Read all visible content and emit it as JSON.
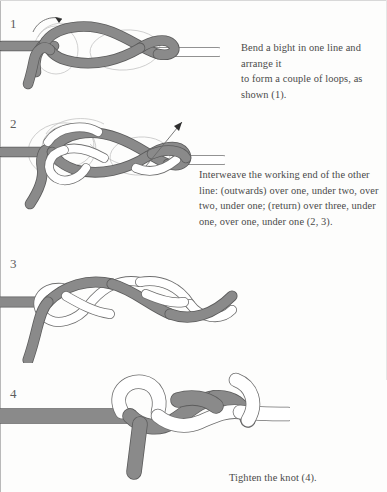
{
  "page": {
    "background_color": "#fdfdfc",
    "width": 387,
    "height": 492
  },
  "colors": {
    "rope_gray_fill": "#8a8a8a",
    "rope_gray_stroke": "#5c5c5c",
    "rope_white_fill": "#ffffff",
    "rope_white_stroke": "#6f6f6f",
    "guide_line": "#b5b5b5",
    "text": "#4a4a4a",
    "step_number": "#5d5d5d",
    "arrow": "#3a3a3a"
  },
  "steps": [
    {
      "number": "1",
      "name": "form-loops",
      "caption": "Bend a bight in one line and arrange it to form a couple of loops, as shown (1).",
      "caption_lines": [
        "Bend a bight in one line and arrange it",
        "to form a couple of loops, as shown (1)."
      ],
      "has_arrow": true,
      "arrow_direction": "up-right"
    },
    {
      "number": "2",
      "name": "interweave",
      "caption": "Interweave the working end of the other line: (outwards) over one, under two, over two, under one; (return) over three, under one, over one, under one (2, 3).",
      "caption_lines": [
        "Interweave the working end of the other",
        "line: (outwards) over one, under two, over",
        "two, under one; (return) over three, under",
        "one, over one, under one (2, 3)."
      ],
      "has_arrow": true,
      "arrow_direction": "up-right"
    },
    {
      "number": "3",
      "name": "completed-weave",
      "caption": "",
      "caption_lines": [],
      "has_arrow": false,
      "arrow_direction": ""
    },
    {
      "number": "4",
      "name": "tightened-knot",
      "caption": "Tighten the knot (4).",
      "caption_lines": [
        "Tighten the knot (4)."
      ],
      "has_arrow": false,
      "arrow_direction": ""
    }
  ]
}
